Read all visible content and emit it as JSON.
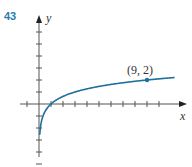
{
  "problem": {
    "number": "43"
  },
  "colors": {
    "curve": "#1f6f9f",
    "axis": "#555555",
    "number": "#2a7ab0"
  },
  "chart_data": {
    "type": "line",
    "title": "",
    "function": "y = log_3(x)",
    "xlabel": "x",
    "ylabel": "y",
    "xlim": [
      -1,
      11
    ],
    "ylim": [
      -5,
      7
    ],
    "grid": false,
    "tick_spacing": 1,
    "series": [
      {
        "name": "curve",
        "x": [
          0.1,
          0.2,
          0.33,
          0.5,
          1,
          2,
          3,
          4,
          5,
          6,
          7,
          8,
          9,
          10,
          11
        ],
        "y": [
          -2.1,
          -1.46,
          -1.0,
          -0.63,
          0,
          0.63,
          1.0,
          1.26,
          1.46,
          1.63,
          1.77,
          1.89,
          2.0,
          2.1,
          2.18
        ]
      }
    ],
    "annotations": [
      {
        "text": "(9, 2)",
        "x": 9,
        "y": 2
      }
    ],
    "x_ticks": [
      -1,
      1,
      2,
      3,
      4,
      5,
      6,
      7,
      8,
      9,
      10
    ],
    "y_ticks": [
      -5,
      -4,
      -3,
      -2,
      -1,
      1,
      2,
      3,
      4,
      5,
      6
    ]
  }
}
